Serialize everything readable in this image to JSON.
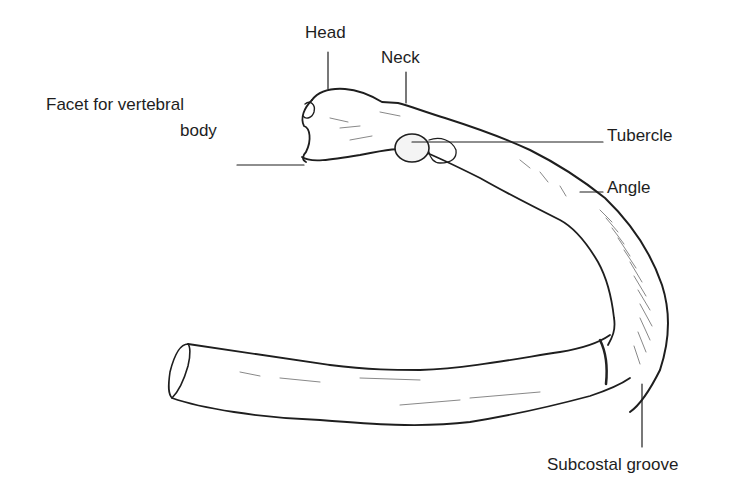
{
  "diagram": {
    "labels": {
      "head": "Head",
      "neck": "Neck",
      "facet_line1": "Facet for vertebral",
      "facet_line2": "body",
      "tubercle": "Tubercle",
      "angle": "Angle",
      "subcostal_groove": "Subcostal groove"
    },
    "colors": {
      "background": "#ffffff",
      "ink": "#1e1e1e"
    }
  }
}
